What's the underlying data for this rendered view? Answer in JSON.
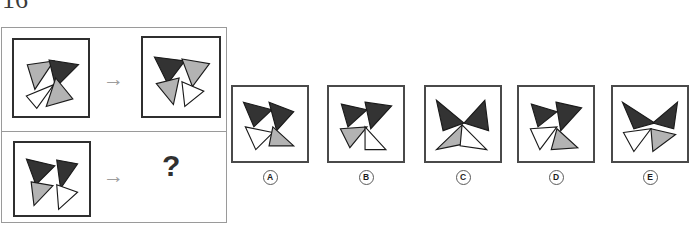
{
  "page": {
    "number": "16",
    "type": "visual-analogy-puzzle"
  },
  "colors": {
    "dark": "#333333",
    "gray": "#b3b3b3",
    "white": "#ffffff",
    "outline": "#1a1a1a",
    "box_border": "#2f2f2f",
    "panel_border": "#9a9a9a",
    "arrow": "#9d9d9d",
    "text": "#1c1c1c"
  },
  "stimulus": {
    "row1": {
      "source_label": "figure-source-row1",
      "arrow": "→",
      "target_label": "figure-target-row1"
    },
    "row2": {
      "source_label": "figure-source-row2",
      "arrow": "→",
      "question": "?"
    }
  },
  "options": [
    {
      "key": "A",
      "label": "A"
    },
    {
      "key": "B",
      "label": "B"
    },
    {
      "key": "C",
      "label": "C"
    },
    {
      "key": "D",
      "label": "D"
    },
    {
      "key": "E",
      "label": "E"
    }
  ],
  "figures": {
    "row1_source": {
      "name": "four-triangle-cluster-source",
      "triangles": [
        {
          "fill": "gray",
          "points": "14,26 42,22 22,52"
        },
        {
          "fill": "dark",
          "points": "37,21 68,26 44,50"
        },
        {
          "fill": "white",
          "points": "13,59 42,47 24,72"
        },
        {
          "fill": "gray",
          "points": "44,40 62,62 34,70"
        }
      ]
    },
    "row1_target": {
      "name": "four-triangle-cluster-target",
      "triangles": [
        {
          "fill": "dark",
          "points": "12,20 44,24 26,48"
        },
        {
          "fill": "gray",
          "points": "41,22 70,27 52,51"
        },
        {
          "fill": "gray",
          "points": "14,48 38,42 32,70"
        },
        {
          "fill": "white",
          "points": "41,46 64,56 44,72"
        }
      ]
    },
    "row2_source": {
      "name": "four-triangle-cluster-question",
      "triangles": [
        {
          "fill": "dark",
          "points": "12,17 42,24 22,44"
        },
        {
          "fill": "dark",
          "points": "44,18 66,22 48,48"
        },
        {
          "fill": "gray",
          "points": "17,41 40,45 20,66"
        },
        {
          "fill": "white",
          "points": "44,44 66,52 46,70"
        }
      ]
    },
    "option_A": {
      "name": "option-a-figure",
      "triangles": [
        {
          "fill": "dark",
          "points": "11,16 41,24 22,42"
        },
        {
          "fill": "dark",
          "points": "38,16 64,26 46,46"
        },
        {
          "fill": "white",
          "points": "13,42 42,48 24,66"
        },
        {
          "fill": "gray",
          "points": "42,42 64,62 38,62"
        }
      ]
    },
    "option_B": {
      "name": "option-b-figure",
      "triangles": [
        {
          "fill": "dark",
          "points": "13,18 40,24 20,42"
        },
        {
          "fill": "dark",
          "points": "38,16 66,20 44,44"
        },
        {
          "fill": "gray",
          "points": "12,44 40,42 22,64"
        },
        {
          "fill": "white",
          "points": "38,42 60,66 38,66"
        }
      ]
    },
    "option_C": {
      "name": "option-c-figure",
      "triangles": [
        {
          "fill": "dark",
          "points": "11,14 40,38 18,46"
        },
        {
          "fill": "dark",
          "points": "40,38 62,14 66,46"
        },
        {
          "fill": "gray",
          "points": "11,66 38,40 40,60"
        },
        {
          "fill": "white",
          "points": "38,40 64,66 36,62"
        }
      ]
    },
    "option_D": {
      "name": "option-d-figure",
      "triangles": [
        {
          "fill": "dark",
          "points": "13,18 40,26 20,42"
        },
        {
          "fill": "dark",
          "points": "39,16 66,22 44,46"
        },
        {
          "fill": "white",
          "points": "12,44 40,42 22,66"
        },
        {
          "fill": "gray",
          "points": "40,44 62,64 34,66"
        }
      ]
    },
    "option_E": {
      "name": "option-e-figure",
      "triangles": [
        {
          "fill": "dark",
          "points": "10,16 44,38 22,44"
        },
        {
          "fill": "dark",
          "points": "42,38 68,16 64,44"
        },
        {
          "fill": "white",
          "points": "11,48 40,44 22,68"
        },
        {
          "fill": "gray",
          "points": "40,44 66,50 42,68"
        }
      ]
    }
  }
}
